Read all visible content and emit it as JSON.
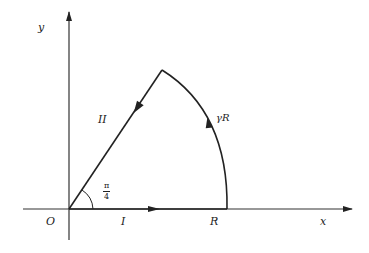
{
  "diagram": {
    "type": "contour",
    "colors": {
      "stroke": "#222222",
      "background": "#ffffff"
    },
    "labels": {
      "y_axis": "y",
      "x_axis": "x",
      "origin": "O",
      "segment_1": "I",
      "segment_2": "II",
      "radius_point": "R",
      "arc": "γR",
      "angle_num": "π",
      "angle_den": "4"
    }
  }
}
